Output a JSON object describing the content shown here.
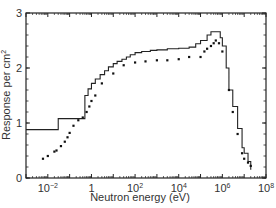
{
  "chart_data": {
    "type": "line",
    "title": "",
    "xlabel": "Neutron energy (eV)",
    "ylabel": "Response per cm²",
    "xscale": "log",
    "xlim": [
      0.001,
      100000000
    ],
    "ylim": [
      0,
      3
    ],
    "x_ticks": [
      {
        "value": 0.01,
        "base": "10",
        "exp": "−2"
      },
      {
        "value": 1,
        "base": "1",
        "exp": ""
      },
      {
        "value": 100,
        "base": "10",
        "exp": "2"
      },
      {
        "value": 10000,
        "base": "10",
        "exp": "4"
      },
      {
        "value": 1000000,
        "base": "10",
        "exp": "6"
      },
      {
        "value": 100000000,
        "base": "10",
        "exp": "8"
      }
    ],
    "y_ticks": [
      0,
      1,
      2,
      3
    ],
    "grid": false,
    "legend": null,
    "series": [
      {
        "name": "calculated response (histogram)",
        "style": "step-line",
        "x": [
          0.001,
          0.03,
          0.03,
          0.5,
          0.5,
          0.7,
          1,
          1.5,
          2.5,
          4,
          6,
          10,
          15,
          25,
          40,
          60,
          100,
          200,
          500,
          1000,
          3000,
          10000,
          30000,
          60000,
          100000,
          200000,
          300000,
          500000,
          800000,
          1000000,
          1500000,
          2000000,
          3000000,
          5000000,
          8000000,
          10000000,
          15000000,
          20000000
        ],
        "y": [
          0.88,
          0.88,
          1.08,
          1.08,
          1.5,
          1.62,
          1.72,
          1.8,
          1.88,
          1.95,
          2.02,
          2.08,
          2.12,
          2.16,
          2.2,
          2.24,
          2.28,
          2.3,
          2.32,
          2.33,
          2.35,
          2.36,
          2.38,
          2.44,
          2.5,
          2.6,
          2.66,
          2.66,
          2.55,
          2.4,
          2.0,
          1.6,
          1.3,
          0.9,
          0.55,
          0.45,
          0.3,
          0.15
        ]
      },
      {
        "name": "measured response (points)",
        "style": "scatter",
        "x": [
          0.006,
          0.01,
          0.02,
          0.025,
          0.04,
          0.06,
          0.08,
          0.1,
          0.15,
          0.25,
          0.4,
          0.6,
          0.8,
          1,
          1.5,
          3,
          10,
          30,
          100,
          300,
          1000,
          3000,
          10000,
          30000,
          100000,
          150000,
          200000,
          300000,
          400000,
          500000,
          700000,
          1000000,
          2000000,
          3000000,
          5000000,
          8000000,
          10000000,
          15000000,
          20000000
        ],
        "y": [
          0.35,
          0.4,
          0.48,
          0.5,
          0.58,
          0.66,
          0.74,
          0.82,
          0.95,
          1.05,
          1.1,
          1.2,
          1.3,
          1.4,
          1.5,
          1.72,
          1.9,
          2.05,
          2.1,
          2.12,
          2.14,
          2.14,
          2.16,
          2.2,
          2.2,
          2.3,
          2.35,
          2.4,
          2.45,
          2.5,
          2.45,
          2.3,
          1.6,
          1.2,
          0.8,
          0.45,
          0.35,
          0.28,
          0.22
        ]
      }
    ]
  }
}
